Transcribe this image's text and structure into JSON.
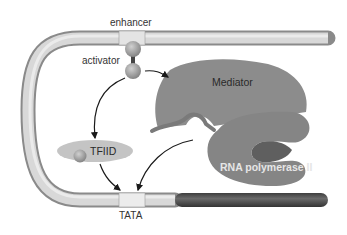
{
  "diagram": {
    "labels": {
      "enhancer": "enhancer",
      "activator": "activator",
      "mediator": "Mediator",
      "tfiid": "TFIID",
      "rna_pol": "RNA polymerase II",
      "tata": "TATA"
    },
    "colors": {
      "dna_tube": "#c8c8c8",
      "dna_edge": "#8a8a8a",
      "coding_region": "#555555",
      "mediator": "#8c8c8c",
      "rna_pol": "#858585",
      "pol_cleft": "#5f5f5f",
      "tfiid": "#c4c4c4",
      "arrow": "#1a1a1a"
    }
  }
}
